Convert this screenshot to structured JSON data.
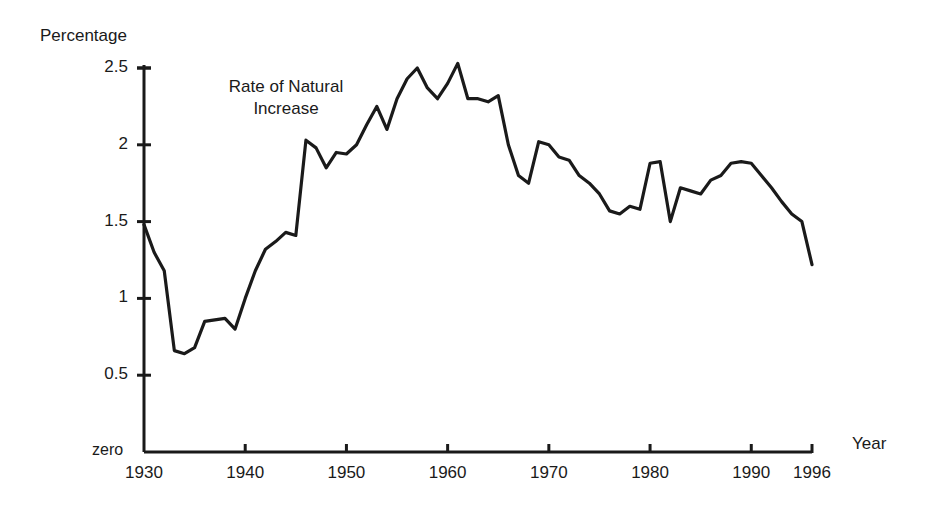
{
  "chart_data": {
    "type": "line",
    "title": "",
    "xlabel": "Year",
    "ylabel": "Percentage",
    "zero_label": "zero",
    "annotation": "Rate of Natural\nIncrease",
    "series_name": "Rate of Natural Increase",
    "line_color": "#1a1a1a",
    "grid": false,
    "legend_position": "none",
    "xlim": [
      1930,
      1996
    ],
    "ylim": [
      0,
      2.6
    ],
    "xticks": [
      1930,
      1940,
      1950,
      1960,
      1970,
      1980,
      1990,
      1996
    ],
    "xtick_labels": [
      "1930",
      "1940",
      "1950",
      "1960",
      "1970",
      "1980",
      "1990",
      "1996"
    ],
    "yticks": [
      0.5,
      1,
      1.5,
      2,
      2.5
    ],
    "ytick_labels": [
      "0.5",
      "1",
      "1.5",
      "2",
      "2.5"
    ],
    "x": [
      1930,
      1931,
      1932,
      1933,
      1934,
      1935,
      1936,
      1937,
      1938,
      1939,
      1940,
      1941,
      1942,
      1943,
      1944,
      1945,
      1946,
      1947,
      1948,
      1949,
      1950,
      1951,
      1952,
      1953,
      1954,
      1955,
      1956,
      1957,
      1958,
      1959,
      1960,
      1961,
      1962,
      1963,
      1964,
      1965,
      1966,
      1967,
      1968,
      1969,
      1970,
      1971,
      1972,
      1973,
      1974,
      1975,
      1976,
      1977,
      1978,
      1979,
      1980,
      1981,
      1982,
      1983,
      1984,
      1985,
      1986,
      1987,
      1988,
      1989,
      1990,
      1991,
      1992,
      1993,
      1994,
      1995,
      1996
    ],
    "values": [
      1.48,
      1.3,
      1.18,
      0.66,
      0.64,
      0.68,
      0.85,
      0.86,
      0.87,
      0.8,
      1.0,
      1.18,
      1.32,
      1.37,
      1.43,
      1.41,
      2.03,
      1.98,
      1.85,
      1.95,
      1.94,
      2.0,
      2.13,
      2.25,
      2.1,
      2.3,
      2.43,
      2.5,
      2.37,
      2.3,
      2.4,
      2.53,
      2.3,
      2.3,
      2.28,
      2.32,
      2.0,
      1.8,
      1.75,
      2.02,
      2.0,
      1.92,
      1.9,
      1.8,
      1.75,
      1.68,
      1.57,
      1.55,
      1.6,
      1.58,
      1.88,
      1.89,
      1.5,
      1.72,
      1.7,
      1.68,
      1.77,
      1.8,
      1.88,
      1.89,
      1.88,
      1.8,
      1.72,
      1.63,
      1.55,
      1.5,
      1.22
    ],
    "annotations": [
      {
        "text": "Rate of Natural Increase",
        "x": 1936,
        "y": 2.2
      }
    ]
  },
  "axis": {
    "y_title": "Percentage",
    "x_title": "Year",
    "zero": "zero"
  }
}
